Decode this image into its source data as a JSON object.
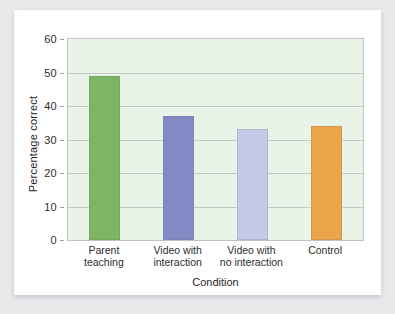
{
  "chart_data": {
    "type": "bar",
    "title": "",
    "subtitle": "",
    "xlabel": "Condition",
    "ylabel": "Percentage correct",
    "categories": [
      "Parent teaching",
      "Video with interaction",
      "Video with no interaction",
      "Control"
    ],
    "category_lines": [
      [
        "Parent",
        "teaching"
      ],
      [
        "Video with",
        "interaction"
      ],
      [
        "Video with",
        "no interaction"
      ],
      [
        "Control",
        ""
      ]
    ],
    "values": [
      49,
      37,
      33,
      34
    ],
    "bar_colors": [
      "#7db563",
      "#8289c4",
      "#c6caea",
      "#eda54a"
    ],
    "ylim": [
      0,
      60
    ],
    "yticks": [
      0,
      10,
      20,
      30,
      40,
      50,
      60
    ],
    "ytick_labels": [
      "0",
      "10",
      "20",
      "30",
      "40",
      "50",
      "60"
    ],
    "grid": true,
    "grid_axis": "y",
    "legend": "none",
    "plot_background": "#eaf3e8",
    "figure_background": "#ffffff",
    "page_background": "#e9eaec",
    "grid_color": "#c3cbc6",
    "axis_color": "#bfc6c2"
  }
}
